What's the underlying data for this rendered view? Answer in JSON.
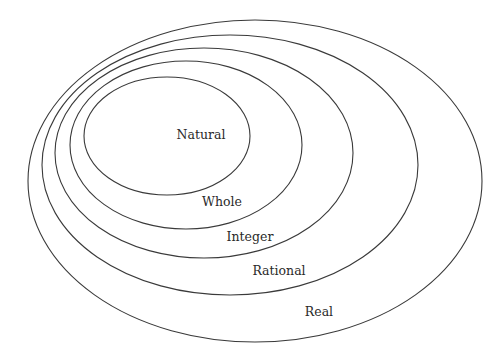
{
  "diagram": {
    "type": "nested-venn",
    "background": "#ffffff",
    "stroke_color": "#3a3a3a",
    "sets": [
      {
        "name": "Real",
        "label": "Real",
        "ellipse": {
          "cx": 255,
          "cy": 181,
          "rx": 227,
          "ry": 161
        },
        "label_pos": {
          "x": 319,
          "y": 312
        }
      },
      {
        "name": "Rational",
        "label": "Rational",
        "ellipse": {
          "cx": 230,
          "cy": 165,
          "rx": 188,
          "ry": 130
        },
        "label_pos": {
          "x": 279,
          "y": 271
        }
      },
      {
        "name": "Integer",
        "label": "Integer",
        "ellipse": {
          "cx": 204,
          "cy": 153,
          "rx": 149,
          "ry": 105
        },
        "label_pos": {
          "x": 250,
          "y": 237
        }
      },
      {
        "name": "Whole",
        "label": "Whole",
        "ellipse": {
          "cx": 186,
          "cy": 145,
          "rx": 116,
          "ry": 84
        },
        "label_pos": {
          "x": 222,
          "y": 202
        }
      },
      {
        "name": "Natural",
        "label": "Natural",
        "ellipse": {
          "cx": 167,
          "cy": 136,
          "rx": 83,
          "ry": 59
        },
        "label_pos": {
          "x": 201,
          "y": 135
        }
      }
    ]
  }
}
